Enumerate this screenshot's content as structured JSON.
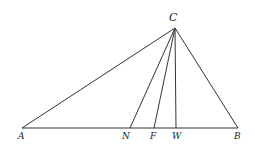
{
  "diagram": {
    "type": "triangle-with-cevians",
    "points": {
      "C": {
        "label": "C",
        "x": 175,
        "y": 28
      },
      "A": {
        "label": "A",
        "x": 22,
        "y": 128
      },
      "N": {
        "label": "N",
        "x": 130,
        "y": 128
      },
      "F": {
        "label": "F",
        "x": 154,
        "y": 128
      },
      "W": {
        "label": "W",
        "x": 176,
        "y": 128
      },
      "B": {
        "label": "B",
        "x": 238,
        "y": 128
      }
    },
    "segments": [
      {
        "from": "A",
        "to": "B"
      },
      {
        "from": "C",
        "to": "A"
      },
      {
        "from": "C",
        "to": "B"
      },
      {
        "from": "C",
        "to": "N"
      },
      {
        "from": "C",
        "to": "F"
      },
      {
        "from": "C",
        "to": "W"
      }
    ],
    "line_color": "#333333"
  }
}
